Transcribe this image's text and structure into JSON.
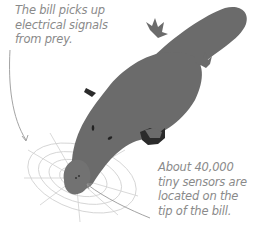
{
  "figure": {
    "annotations": [
      {
        "id": "electrical-signals",
        "lines": [
          "The bill picks up",
          "electrical signals",
          "from prey."
        ]
      },
      {
        "id": "sensors",
        "lines": [
          "About 40,000",
          "tiny sensors are",
          "located on the",
          "tip of the bill."
        ]
      }
    ],
    "colors": {
      "body": "#6b6b6b",
      "feet_shadow": "#2b2b2b",
      "text": "#8a8a8a",
      "field_lines": "#c8c8c8",
      "arrows": "#999999"
    }
  }
}
